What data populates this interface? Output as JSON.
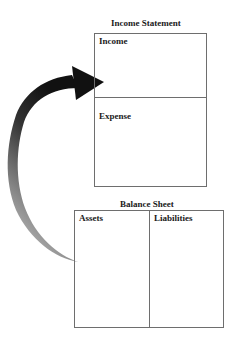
{
  "income_statement": {
    "title": "Income Statement",
    "sections": [
      {
        "label": "Income"
      },
      {
        "label": "Expense"
      }
    ]
  },
  "balance_sheet": {
    "title": "Balance Sheet",
    "columns": [
      {
        "label": "Assets"
      },
      {
        "label": "Liabilities"
      }
    ]
  },
  "arrow": {
    "direction": "from balance sheet assets to income statement",
    "colors": {
      "head": "#1a1a1a",
      "tail": "#b8b8b8"
    }
  }
}
